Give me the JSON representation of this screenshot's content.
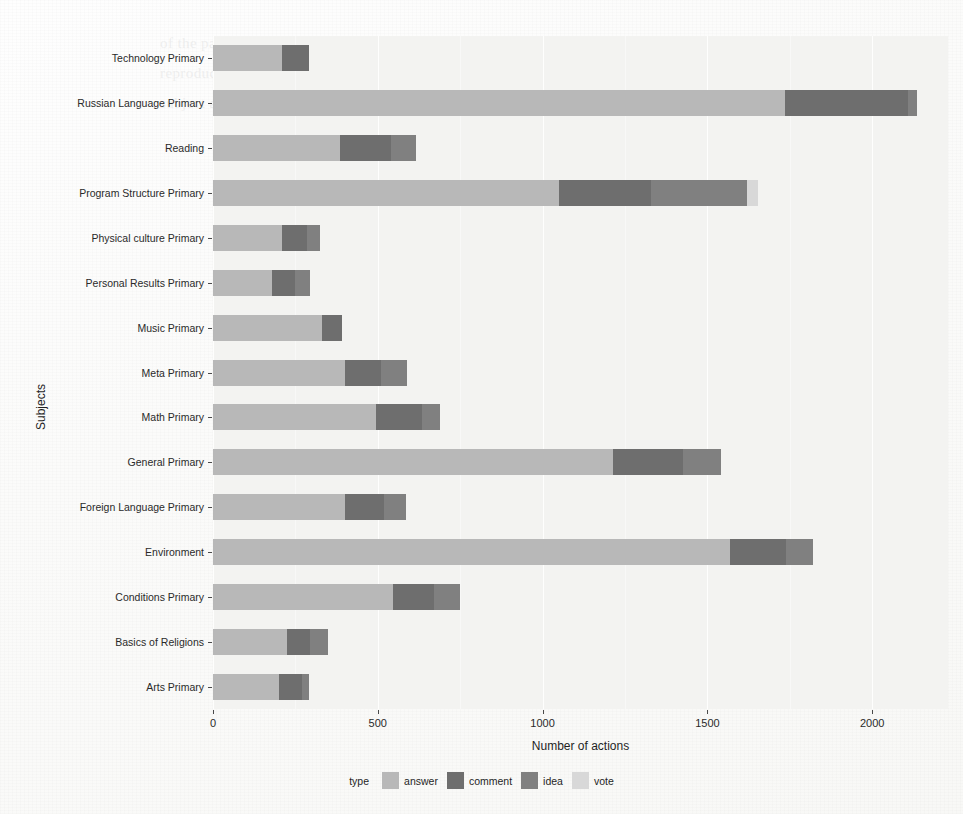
{
  "chart_data": {
    "type": "bar",
    "subtype": "horizontal-stacked",
    "title": "",
    "xlabel": "Number of actions",
    "ylabel": "Subjects",
    "xlim": [
      0,
      2230
    ],
    "xticks": [
      0,
      500,
      1000,
      1500,
      2000
    ],
    "xtick_labels": [
      "0",
      "500",
      "1000",
      "1500",
      "2000"
    ],
    "grid": true,
    "legend": {
      "title": "type",
      "position": "bottom",
      "entries": [
        {
          "name": "answer",
          "color": "#b8b8b8"
        },
        {
          "name": "comment",
          "color": "#6e6e6e"
        },
        {
          "name": "idea",
          "color": "#808080"
        },
        {
          "name": "vote",
          "color": "#d8d8d8"
        }
      ]
    },
    "categories": [
      "Technology Primary",
      "Russian Language Primary",
      "Reading",
      "Program Structure Primary",
      "Physical culture Primary",
      "Personal Results Primary",
      "Music Primary",
      "Meta Primary",
      "Math Primary",
      "General Primary",
      "Foreign Language Primary",
      "Environment",
      "Conditions Primary",
      "Basics of Religions",
      "Arts Primary"
    ],
    "series": [
      {
        "name": "answer",
        "color": "#b8b8b8",
        "values": [
          210,
          1735,
          385,
          1050,
          210,
          180,
          330,
          400,
          495,
          1215,
          400,
          1570,
          545,
          225,
          200
        ]
      },
      {
        "name": "comment",
        "color": "#6e6e6e",
        "values": [
          80,
          375,
          155,
          280,
          75,
          70,
          60,
          110,
          140,
          210,
          120,
          170,
          125,
          70,
          70
        ]
      },
      {
        "name": "idea",
        "color": "#808080",
        "values": [
          0,
          25,
          75,
          290,
          40,
          45,
          0,
          80,
          55,
          115,
          65,
          80,
          80,
          55,
          20
        ]
      },
      {
        "name": "vote",
        "color": "#d8d8d8",
        "values": [
          0,
          0,
          0,
          35,
          0,
          0,
          0,
          0,
          0,
          0,
          0,
          0,
          0,
          0,
          0
        ]
      }
    ],
    "totals": [
      290,
      2135,
      615,
      1655,
      325,
      295,
      390,
      590,
      690,
      1540,
      585,
      1820,
      750,
      350,
      290
    ]
  },
  "style": {
    "panel_background": "#f3f3f1",
    "gridline_color": "#ffffff",
    "page_background": "#ffffff",
    "text_color": "#1f1f1f"
  },
  "ghost_page_text": "of the page behind the printed chart remains faintly visible through the paper in this scanned reproduction of the original document figure showing counts of recorded actions grouped by school subject and by the kind of action performed"
}
